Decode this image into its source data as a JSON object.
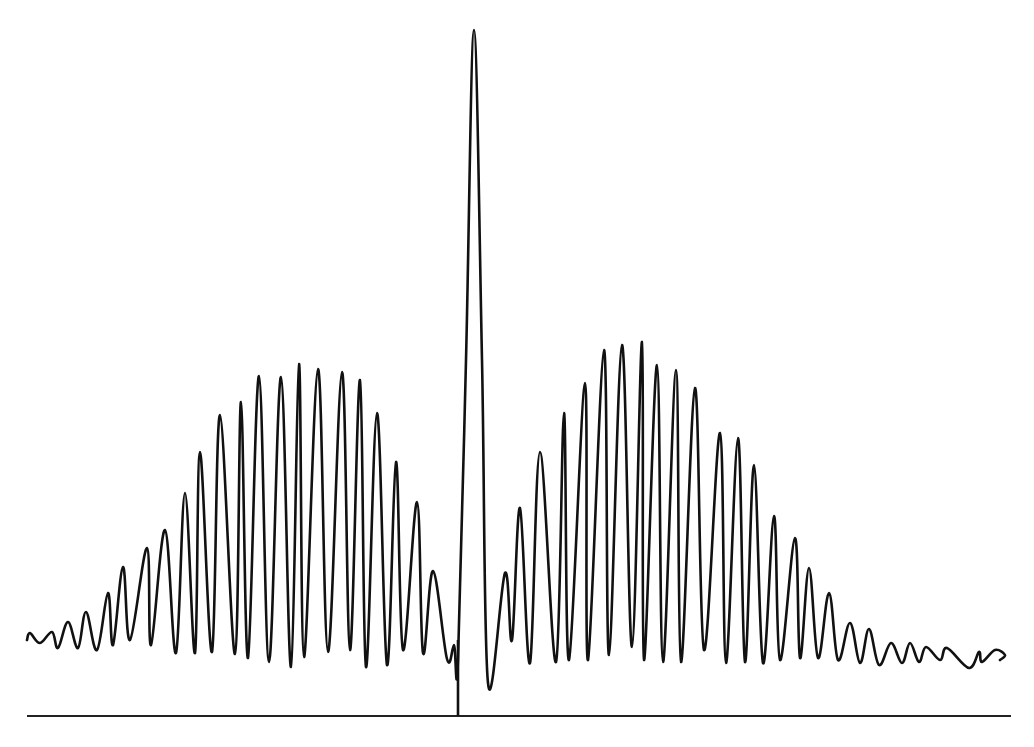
{
  "chart_data": {
    "type": "line",
    "title": "",
    "xlabel": "",
    "ylabel": "",
    "grid": false,
    "legend": null,
    "coordinate_space": "pixel",
    "baseline": {
      "x_start": 27,
      "x_end": 1011,
      "y": 716
    },
    "center_marker": {
      "x": 458,
      "y_top": 640,
      "y_bottom": 716
    },
    "central_peak": {
      "x": 474,
      "y": 30
    },
    "colors": {
      "trace": "#111111",
      "baseline": "#222222",
      "background": "#ffffff"
    },
    "series": [
      {
        "name": "signal",
        "points": [
          [
            27,
            640
          ],
          [
            30,
            633
          ],
          [
            40,
            643
          ],
          [
            52,
            632
          ],
          [
            58,
            648
          ],
          [
            68,
            622
          ],
          [
            78,
            648
          ],
          [
            86,
            612
          ],
          [
            97,
            650
          ],
          [
            108,
            593
          ],
          [
            113,
            645
          ],
          [
            123,
            567
          ],
          [
            130,
            640
          ],
          [
            147,
            548
          ],
          [
            151,
            645
          ],
          [
            165,
            530
          ],
          [
            176,
            653
          ],
          [
            185,
            493
          ],
          [
            195,
            653
          ],
          [
            200,
            452
          ],
          [
            212,
            652
          ],
          [
            220,
            415
          ],
          [
            235,
            654
          ],
          [
            241,
            402
          ],
          [
            248,
            658
          ],
          [
            259,
            376
          ],
          [
            269,
            662
          ],
          [
            281,
            377
          ],
          [
            291,
            667
          ],
          [
            299,
            364
          ],
          [
            304,
            657
          ],
          [
            318,
            369
          ],
          [
            328,
            652
          ],
          [
            342,
            372
          ],
          [
            350,
            650
          ],
          [
            360,
            380
          ],
          [
            366,
            667
          ],
          [
            377,
            413
          ],
          [
            387,
            665
          ],
          [
            396,
            462
          ],
          [
            403,
            650
          ],
          [
            417,
            502
          ],
          [
            423,
            653
          ],
          [
            433,
            571
          ],
          [
            447,
            659
          ],
          [
            454,
            645
          ],
          [
            458,
            660
          ],
          [
            466,
            360
          ],
          [
            474,
            30
          ],
          [
            482,
            360
          ],
          [
            488,
            683
          ],
          [
            505,
            573
          ],
          [
            512,
            640
          ],
          [
            520,
            508
          ],
          [
            530,
            663
          ],
          [
            540,
            452
          ],
          [
            556,
            662
          ],
          [
            564,
            413
          ],
          [
            569,
            660
          ],
          [
            585,
            383
          ],
          [
            588,
            660
          ],
          [
            604,
            350
          ],
          [
            609,
            655
          ],
          [
            622,
            345
          ],
          [
            632,
            647
          ],
          [
            642,
            342
          ],
          [
            644,
            660
          ],
          [
            657,
            365
          ],
          [
            663,
            662
          ],
          [
            676,
            370
          ],
          [
            681,
            662
          ],
          [
            695,
            388
          ],
          [
            704,
            650
          ],
          [
            720,
            433
          ],
          [
            726,
            663
          ],
          [
            738,
            438
          ],
          [
            745,
            662
          ],
          [
            754,
            465
          ],
          [
            763,
            663
          ],
          [
            774,
            516
          ],
          [
            780,
            660
          ],
          [
            795,
            538
          ],
          [
            800,
            658
          ],
          [
            809,
            568
          ],
          [
            818,
            658
          ],
          [
            829,
            593
          ],
          [
            838,
            660
          ],
          [
            850,
            623
          ],
          [
            860,
            663
          ],
          [
            869,
            629
          ],
          [
            879,
            665
          ],
          [
            891,
            643
          ],
          [
            902,
            663
          ],
          [
            910,
            643
          ],
          [
            919,
            662
          ],
          [
            926,
            647
          ],
          [
            940,
            660
          ],
          [
            947,
            648
          ],
          [
            969,
            668
          ],
          [
            979,
            652
          ],
          [
            982,
            662
          ],
          [
            995,
            650
          ],
          [
            1005,
            655
          ],
          [
            1000,
            660
          ]
        ]
      }
    ],
    "envelopes": {
      "left_packet": {
        "x_range": [
          27,
          455
        ],
        "max_peak_x": 299,
        "max_peak_y": 364
      },
      "right_packet": {
        "x_range": [
          500,
          1005
        ],
        "max_peak_x": 642,
        "max_peak_y": 342
      }
    }
  }
}
